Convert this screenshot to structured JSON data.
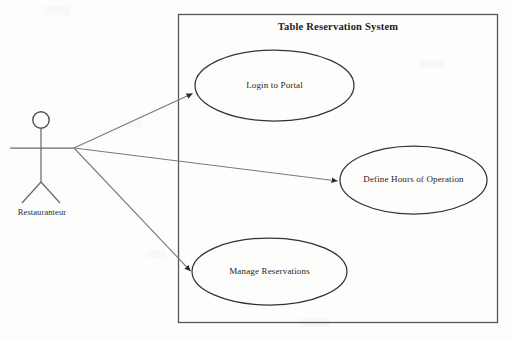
{
  "diagram": {
    "kind": "uml-use-case-diagram",
    "system": {
      "title": "Table Reservation System",
      "boundary": {
        "x": 178,
        "y": 14,
        "width": 320,
        "height": 309
      }
    },
    "actors": [
      {
        "id": "restauranteur",
        "label": "Restauranteur",
        "head": {
          "cx": 41,
          "cy": 120,
          "r": 8
        },
        "body": {
          "x": 41,
          "y1": 128,
          "y2": 182
        },
        "arms": {
          "y": 148,
          "x1": 10,
          "x2": 74
        },
        "legs": {
          "x": 41,
          "y": 182,
          "lx": 22,
          "rx": 60,
          "ly": 203
        }
      }
    ],
    "use_cases": [
      {
        "id": "uc1",
        "label": "Login to Portal",
        "cx": 274.5,
        "cy": 85.5,
        "rx": 79.5,
        "ry": 35.5
      },
      {
        "id": "uc2",
        "label": "Define Hours of Operation",
        "cx": 413.5,
        "cy": 180,
        "rx": 73.5,
        "ry": 34
      },
      {
        "id": "uc3",
        "label": "Manage Reservations",
        "cx": 269.5,
        "cy": 271.5,
        "rx": 77.5,
        "ry": 33.5
      }
    ],
    "associations": [
      {
        "from": "restauranteur",
        "to": "uc1",
        "x1": 74,
        "y1": 148,
        "x2": 194,
        "y2": 93,
        "arrow": "solid"
      },
      {
        "from": "restauranteur",
        "to": "uc2",
        "x1": 74,
        "y1": 148,
        "x2": 339,
        "y2": 181,
        "arrow": "solid"
      },
      {
        "from": "restauranteur",
        "to": "uc3",
        "x1": 74,
        "y1": 148,
        "x2": 192,
        "y2": 272,
        "arrow": "solid"
      }
    ],
    "colors": {
      "background": "#fdfdfc",
      "stroke": "#595959",
      "boundary_stroke": "#565656",
      "ellipse_stroke": "#333333",
      "text": "#262626"
    }
  }
}
